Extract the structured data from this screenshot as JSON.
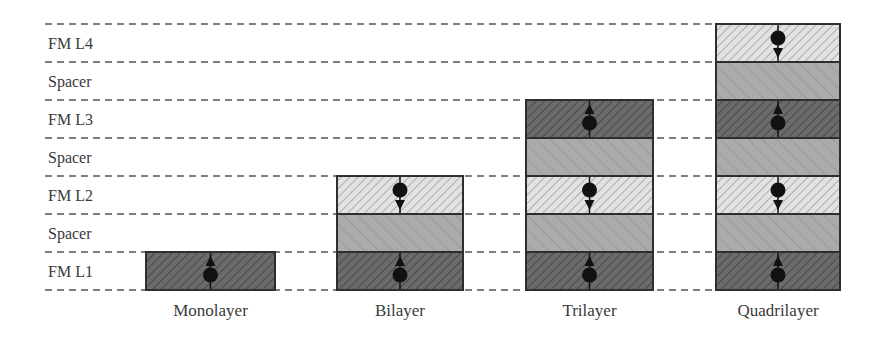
{
  "rows": [
    {
      "label": "FM L4",
      "kind": "fm"
    },
    {
      "label": "Spacer",
      "kind": "spacer"
    },
    {
      "label": "FM L3",
      "kind": "fm"
    },
    {
      "label": "Spacer",
      "kind": "spacer"
    },
    {
      "label": "FM L2",
      "kind": "fm"
    },
    {
      "label": "Spacer",
      "kind": "spacer"
    },
    {
      "label": "FM L1",
      "kind": "fm"
    }
  ],
  "stacks": [
    {
      "label": "Monolayer",
      "layers": [
        {
          "kind": "fm",
          "spin": "up"
        }
      ]
    },
    {
      "label": "Bilayer",
      "layers": [
        {
          "kind": "fm",
          "spin": "up"
        },
        {
          "kind": "spacer"
        },
        {
          "kind": "fm",
          "spin": "down"
        }
      ]
    },
    {
      "label": "Trilayer",
      "layers": [
        {
          "kind": "fm",
          "spin": "up"
        },
        {
          "kind": "spacer"
        },
        {
          "kind": "fm",
          "spin": "down"
        },
        {
          "kind": "spacer"
        },
        {
          "kind": "fm",
          "spin": "up"
        }
      ]
    },
    {
      "label": "Quadrilayer",
      "layers": [
        {
          "kind": "fm",
          "spin": "up"
        },
        {
          "kind": "spacer"
        },
        {
          "kind": "fm",
          "spin": "down"
        },
        {
          "kind": "spacer"
        },
        {
          "kind": "fm",
          "spin": "up"
        },
        {
          "kind": "spacer"
        },
        {
          "kind": "fm",
          "spin": "down"
        }
      ]
    }
  ],
  "colors": {
    "fm_up": "#6b6b6b",
    "fm_down": "#dcdcdc",
    "spacer": "#a9a9a9",
    "outline": "#2e2e2e",
    "dash": "#555555",
    "text": "#3a3a3a"
  }
}
